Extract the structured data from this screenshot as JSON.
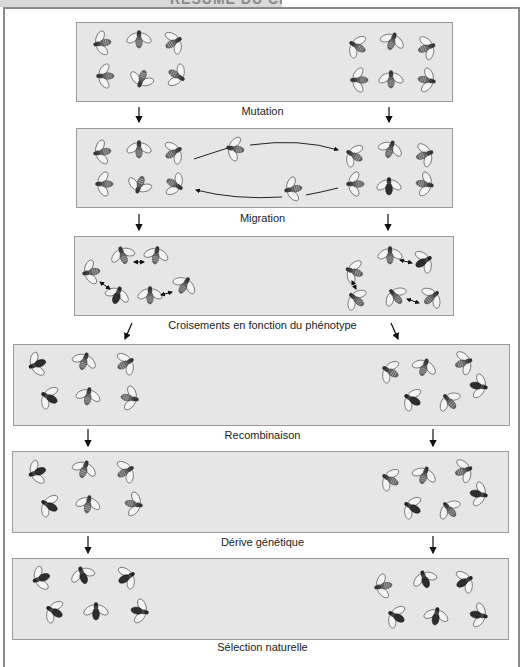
{
  "header": {
    "title": "RÉSUMÉ DU CHAPITRE"
  },
  "steps": [
    {
      "label": "Mutation"
    },
    {
      "label": "Migration"
    },
    {
      "label": "Croisements en fonction du phénotype"
    },
    {
      "label": "Recombinaison"
    },
    {
      "label": "Dérive génétique"
    },
    {
      "label": "Sélection naturelle"
    }
  ],
  "icons": {
    "fly": "fruit-fly-icon",
    "arrow": "arrow-down-icon",
    "migration_arrow": "curved-arrow-icon",
    "mating_arrow": "double-arrow-icon"
  },
  "colors": {
    "panel_bg": "#e6e6e6",
    "panel_border": "#9a9a9a",
    "frame": "#8c8c8c",
    "text": "#222222",
    "fly_body": "#555555",
    "fly_body_dark": "#2e2e2e"
  }
}
